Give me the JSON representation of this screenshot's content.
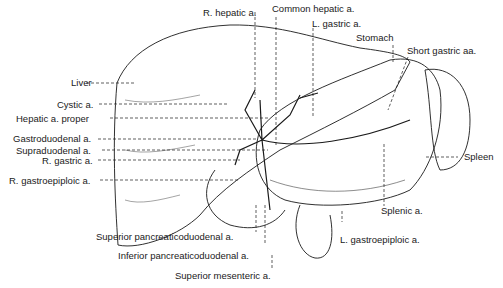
{
  "figure": {
    "labels": {
      "r_hepatic": "R. hepatic a.",
      "common_hepatic": "Common hepatic a.",
      "l_gastric": "L. gastric a.",
      "stomach": "Stomach",
      "short_gastric": "Short gastric aa.",
      "liver": "Liver",
      "cystic": "Cystic a.",
      "hepatic_proper": "Hepatic a. proper",
      "gastroduodenal": "Gastroduodenal a.",
      "supraduodenal": "Supraduodenal a.",
      "r_gastric": "R. gastric a.",
      "r_gastroepiploic": "R. gastroepiploic a.",
      "spleen": "Spleen",
      "splenic": "Splenic a.",
      "l_gastroepiploic": "L. gastroepiploic a.",
      "sup_pancreaticoduodenal": "Superior pancreaticoduodenal a.",
      "inf_pancreaticoduodenal": "Inferior pancreaticoduodenal a.",
      "sup_mesenteric": "Superior mesenteric a."
    },
    "colors": {
      "ink": "#1a1a1a",
      "paper": "#ffffff"
    }
  }
}
